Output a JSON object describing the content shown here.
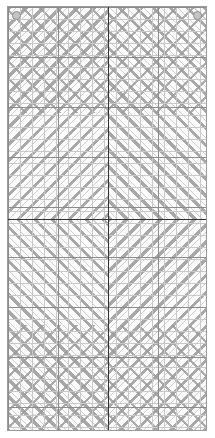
{
  "document": {
    "title": "Twill Weave Draft Pattern",
    "type": "pattern-draft"
  },
  "canvas": {
    "width_px": 215,
    "height_px": 438,
    "background_color": "#ffffff"
  },
  "frame": {
    "left_px": 7,
    "top_px": 6,
    "width_px": 200,
    "height_px": 425,
    "border_color": "#9a9a9a",
    "fill_color": "#fbfbfb",
    "label": "pattern drawing frame"
  },
  "grid": {
    "fine_cell_px": 12,
    "fine_line_color": "#c9c9c9",
    "block_cell_px": 50,
    "block_line_color": "#8c8c8c",
    "axis_color": "#333333",
    "axis_vertical_x_px": 100,
    "axis_horizontal_y_px": 212,
    "label": "grid overlay"
  },
  "pattern": {
    "hatch_color": "#a8a8a8",
    "chevron_color": "#9d9d9d",
    "repeat_px": 12,
    "quadrants": [
      {
        "name": "top-left",
        "hatch_direction": "135deg",
        "label": "Quadrant TL"
      },
      {
        "name": "top-right",
        "hatch_direction": "45deg",
        "label": "Quadrant TR"
      },
      {
        "name": "bottom-left",
        "hatch_direction": "45deg",
        "label": "Quadrant BL"
      },
      {
        "name": "bottom-right",
        "hatch_direction": "135deg",
        "label": "Quadrant BR"
      }
    ]
  },
  "registration_marks": [
    {
      "position": "top-left",
      "shape": "circle",
      "fill": "#c4c4c4",
      "stroke": "#8f8f8f"
    },
    {
      "position": "top-right",
      "shape": "circle",
      "fill": "#c4c4c4",
      "stroke": "#8f8f8f"
    }
  ]
}
